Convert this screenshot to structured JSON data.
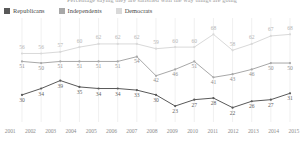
{
  "title": {
    "text": "Percentage saying they are satisfied with the way things are going",
    "clipped": true
  },
  "legend": {
    "position": "top-left",
    "items": [
      {
        "label": "Republicans",
        "color": "#595959",
        "series": "republicans"
      },
      {
        "label": "Independents",
        "color": "#a8a8a8",
        "series": "independents"
      },
      {
        "label": "Democrats",
        "color": "#d9d9d9",
        "series": "democrats"
      }
    ]
  },
  "chart_data": {
    "type": "line",
    "title": "Percentage saying they are satisfied with the way things are going",
    "xlabel": "",
    "ylabel": "",
    "grid": true,
    "grid_axis": "x",
    "legend_position": "top-left",
    "ylim": [
      18,
      72
    ],
    "data_labels": true,
    "categories": [
      "2001",
      "2002",
      "2003",
      "2004",
      "2005",
      "2006",
      "2007",
      "2008",
      "2009",
      "2010",
      "2011",
      "2012",
      "2013",
      "2014",
      "2015"
    ],
    "series": [
      {
        "name": "Republicans",
        "color": "#595959",
        "values": [
          30,
          34,
          39,
          35,
          34,
          34,
          33,
          30,
          23,
          27,
          28,
          22,
          26,
          27,
          31
        ]
      },
      {
        "name": "Independents",
        "color": "#a8a8a8",
        "values": [
          51,
          50,
          51,
          51,
          51,
          51,
          54,
          42,
          46,
          51,
          41,
          43,
          46,
          50,
          50
        ]
      },
      {
        "name": "Democrats",
        "color": "#d9d9d9",
        "values": [
          56,
          56,
          57,
          60,
          62,
          62,
          62,
          59,
          60,
          60,
          68,
          58,
          62,
          67,
          68
        ]
      }
    ]
  }
}
